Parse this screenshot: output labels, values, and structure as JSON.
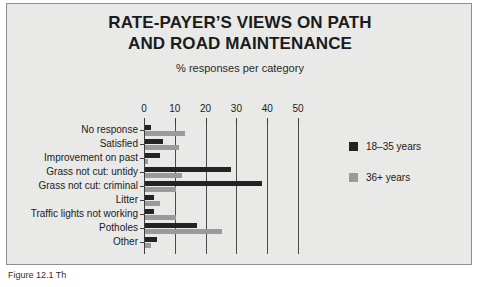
{
  "figure": {
    "title_lines": [
      "RATE-PAYER’S VIEWS ON PATH",
      "AND ROAD MAINTENANCE"
    ],
    "subtitle": "% responses per category",
    "caption": "Figure 12.1  Th",
    "background_color": "#e9e9e7",
    "border_color": "#8e8e8c"
  },
  "chart_data": {
    "type": "bar",
    "orientation": "horizontal",
    "title": "RATE-PAYER’S VIEWS ON PATH AND ROAD MAINTENANCE",
    "subtitle": "% responses per category",
    "xlabel": "",
    "ylabel": "",
    "xlim": [
      0,
      50
    ],
    "xticks": [
      0,
      10,
      20,
      30,
      40,
      50
    ],
    "xtick_labels": [
      "0",
      "10",
      "20",
      "30",
      "40",
      "50"
    ],
    "grid": true,
    "legend_position": "right",
    "categories": [
      "No response",
      "Satisfied",
      "Improvement on past",
      "Grass not cut: untidy",
      "Grass not cut: criminal",
      "Litter",
      "Traffic lights not working",
      "Potholes",
      "Other"
    ],
    "series": [
      {
        "name": "18–35 years",
        "color": "#232323",
        "values": [
          2,
          6,
          5,
          28,
          38,
          3,
          3,
          17,
          4
        ]
      },
      {
        "name": "36+ years",
        "color": "#9a9a9a",
        "values": [
          13,
          11,
          1,
          12,
          10,
          5,
          10,
          25,
          2
        ]
      }
    ]
  }
}
